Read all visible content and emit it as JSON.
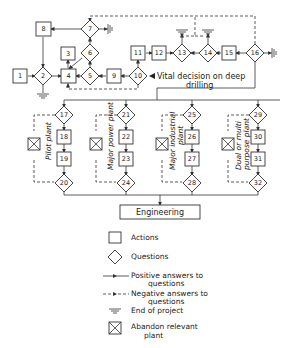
{
  "nodes": {
    "n1": "1",
    "n2": "2",
    "n3": "3",
    "n4": "4",
    "n5": "5",
    "n6": "6",
    "n7": "7",
    "n8": "8",
    "n9": "9",
    "n10": "10",
    "n11": "11",
    "n12": "12",
    "n13": "13",
    "n14": "14",
    "n15": "15",
    "n16": "16",
    "n17": "17",
    "n18": "18",
    "n19": "19",
    "n20": "20",
    "n21": "21",
    "n22": "22",
    "n23": "23",
    "n24": "24",
    "n25": "25",
    "n26": "26",
    "n27": "27",
    "n28": "28",
    "n29": "29",
    "n30": "30",
    "n31": "31",
    "n32": "32"
  },
  "annotations": {
    "vital_decision_line1": "Vital decision on deep",
    "vital_decision_line2": "drilling"
  },
  "branches": {
    "pilot": "Pilot plant",
    "power": "Major power plant",
    "industrial_line1": "Major industrial",
    "industrial_line2": "plant",
    "dual_line1": "Dual or multi",
    "dual_line2": "purpose plant"
  },
  "engineering": "Engineering",
  "legend": {
    "actions": "Actions",
    "questions": "Questions",
    "positive_line1": "Positive answers to",
    "positive_line2": "questions",
    "negative_line1": "Negative answers to",
    "negative_line2": "questions",
    "end": "End of project",
    "abandon_line1": "Abandon relevant",
    "abandon_line2": "plant"
  }
}
